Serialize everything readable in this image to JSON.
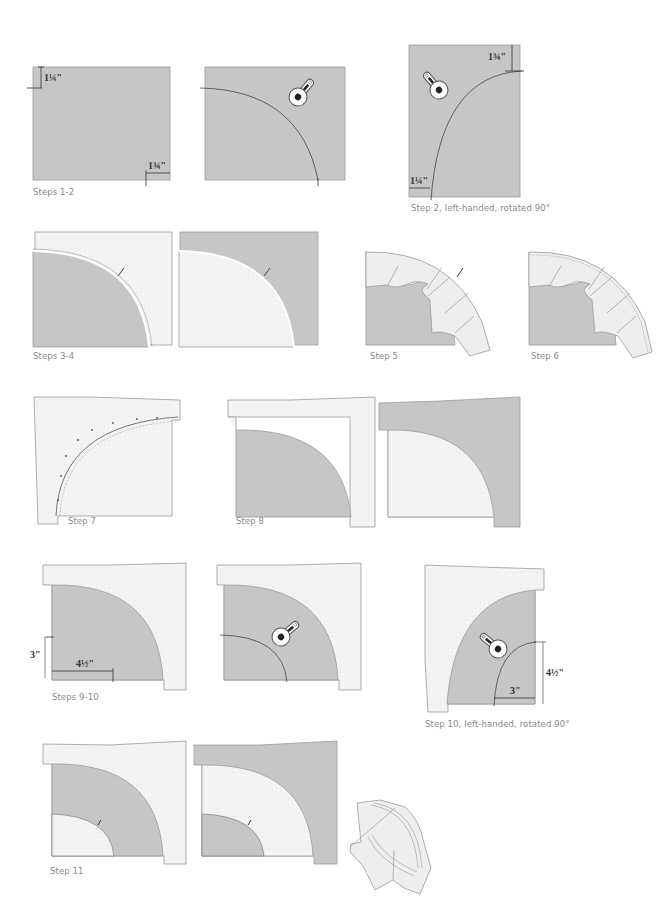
{
  "figure": {
    "colors": {
      "fabric_dark": "#c6c6c6",
      "fabric_light": "#f3f3f3",
      "outline": "#9b9b9b",
      "seam_line": "#555555",
      "caption_text": "#8a8a8a"
    },
    "captions": {
      "steps_1_2": "Steps 1-2",
      "step_2_left": "Step 2, left-handed, rotated 90°",
      "steps_3_4": "Steps 3-4",
      "step_5": "Step 5",
      "step_6": "Step 6",
      "step_7": "Step 7",
      "step_8": "Step 8",
      "steps_9_10": "Steps 9-10",
      "step_10_left": "Step 10, left-handed, rotated 90°",
      "step_11": "Step 11"
    },
    "measurements": {
      "step1_top": "1¼\"",
      "step1_bottom": "1¾\"",
      "step2_left_top": "1¾\"",
      "step2_left_bottom": "1¼\"",
      "step9_vertical": "3\"",
      "step9_horizontal": "4½\"",
      "step10_left_vertical": "4½\"",
      "step10_left_horizontal": "3\""
    },
    "icons": {
      "rotary_cutter": "rotary-cutter-icon"
    }
  }
}
